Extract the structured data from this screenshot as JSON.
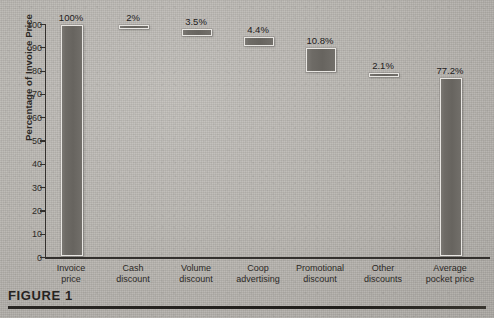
{
  "figure": {
    "caption": "FIGURE 1"
  },
  "chart_data": {
    "type": "bar",
    "title": "",
    "subtitle": "",
    "xlabel": "",
    "ylabel": "Percentage of Invoice Price",
    "ylim": [
      0,
      100
    ],
    "yticks": [
      0,
      10,
      20,
      30,
      40,
      50,
      60,
      70,
      80,
      90,
      100
    ],
    "ytick_labels": [
      "0",
      "10",
      "20",
      "30",
      "40",
      "50",
      "60",
      "70",
      "80",
      "90",
      "100"
    ],
    "grid": false,
    "legend": "none",
    "waterfall": true,
    "categories": [
      "Invoice price",
      "Cash discount",
      "Volume discount",
      "Coop advertising",
      "Promotional discount",
      "Other discounts",
      "Average pocket price"
    ],
    "category_lines": [
      [
        "Invoice",
        "price"
      ],
      [
        "Cash",
        "discount"
      ],
      [
        "Volume",
        "discount"
      ],
      [
        "Coop",
        "advertising"
      ],
      [
        "Promotional",
        "discount"
      ],
      [
        "Other",
        "discounts"
      ],
      [
        "Average",
        "pocket price"
      ]
    ],
    "values": [
      100,
      2,
      3.5,
      4.4,
      10.8,
      2.1,
      77.2
    ],
    "data_labels": [
      "100%",
      "2%",
      "3.5%",
      "4.4%",
      "10.8%",
      "2.1%",
      "77.2%"
    ],
    "bar_bottoms": [
      0,
      98,
      94.5,
      90.1,
      79.3,
      77.2,
      0
    ],
    "bar_tops": [
      100,
      100,
      98,
      94.5,
      90.1,
      79.3,
      77.2
    ],
    "bar_widths_px": [
      20,
      28,
      28,
      28,
      28,
      28,
      20
    ],
    "bar_centers_px": [
      71,
      133,
      196,
      258,
      320,
      383,
      450
    ],
    "colors": {
      "bar_fill": "#6e6b66",
      "bar_outline": "#e8e6e2",
      "axis": "#33302d",
      "text": "#2c2926",
      "background": "#b9b6b1",
      "caption_rule": "#26231f"
    }
  }
}
